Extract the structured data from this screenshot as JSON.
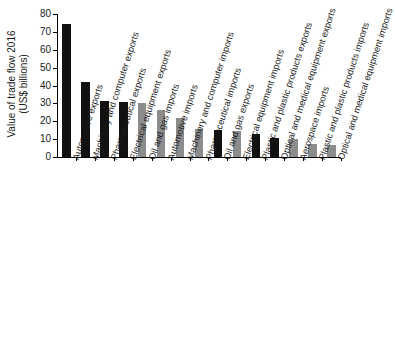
{
  "chart_data": {
    "type": "bar",
    "title": "",
    "xlabel": "",
    "ylabel": "Value of trade flow 2016 (US$ billions)",
    "ylabel_line1": "Value of trade flow 2016",
    "ylabel_line2": "(US$ billions)",
    "ylim": [
      0,
      80
    ],
    "yticks": [
      0,
      10,
      20,
      30,
      40,
      50,
      60,
      70,
      80
    ],
    "ytick_labels": [
      "0",
      "10",
      "20",
      "30",
      "40",
      "50",
      "60",
      "70",
      "80"
    ],
    "grid": false,
    "legend": "none",
    "categories": [
      "Automotive exports",
      "Machinery and computer exports",
      "Pharmaceutical exports",
      "Electrical equipment exports",
      "Oil and gas imports",
      "Automotive imports",
      "Machinery and computer imports",
      "Pharmaceutical imports",
      "Oil and gas exports",
      "Electrical equipment imports",
      "Plastic and plastic products exports",
      "Optical and medical equipment exports",
      "Aerospace imports",
      "Plastic and plastic products imports",
      "Optical and medical equipment imports"
    ],
    "values": [
      74.5,
      41.8,
      31.2,
      30.7,
      30.1,
      26.3,
      22.0,
      15.5,
      15.0,
      14.8,
      13.1,
      10.8,
      9.8,
      7.1,
      6.9
    ],
    "bar_colors": [
      "#111111",
      "#111111",
      "#111111",
      "#111111",
      "#8c8c8c",
      "#8c8c8c",
      "#8c8c8c",
      "#8c8c8c",
      "#111111",
      "#8c8c8c",
      "#111111",
      "#111111",
      "#8c8c8c",
      "#8c8c8c",
      "#8c8c8c"
    ],
    "series_colors": {
      "exports": "#111111",
      "imports": "#8c8c8c"
    }
  }
}
